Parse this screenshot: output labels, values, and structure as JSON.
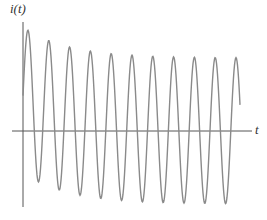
{
  "chart_data": {
    "type": "line",
    "title": "",
    "xlabel": "t",
    "ylabel": "i(t)",
    "grid": false,
    "legend": null,
    "series": [
      {
        "name": "i(t)",
        "color": "#8a8a8a",
        "model": {
          "form": "A*sin(w*t + phi) + D*exp(-t/tau)",
          "amplitude_px": 73,
          "period_px": 20.8,
          "offset_initial_px": 31,
          "tau_px": 45
        },
        "peaks_approx": [
          {
            "x": 28,
            "y": 27
          },
          {
            "x": 49,
            "y": 35
          },
          {
            "x": 70,
            "y": 46
          },
          {
            "x": 90,
            "y": 51
          },
          {
            "x": 111,
            "y": 54
          },
          {
            "x": 131,
            "y": 56
          },
          {
            "x": 152,
            "y": 57
          },
          {
            "x": 173,
            "y": 57
          },
          {
            "x": 194,
            "y": 57
          },
          {
            "x": 215,
            "y": 57
          },
          {
            "x": 236,
            "y": 57
          }
        ],
        "troughs_approx": [
          {
            "x": 39,
            "y": 172
          },
          {
            "x": 59,
            "y": 183
          },
          {
            "x": 80,
            "y": 190
          },
          {
            "x": 101,
            "y": 197
          },
          {
            "x": 121,
            "y": 201
          },
          {
            "x": 142,
            "y": 202
          },
          {
            "x": 163,
            "y": 203
          },
          {
            "x": 184,
            "y": 203
          },
          {
            "x": 205,
            "y": 203
          },
          {
            "x": 226,
            "y": 203
          }
        ]
      }
    ],
    "axes": {
      "origin_px": {
        "x": 23,
        "y": 131
      },
      "x_axis": {
        "from": 12,
        "to": 252
      },
      "y_axis": {
        "from": 22,
        "to": 207
      },
      "t_start_px": 23,
      "t_end_px": 240
    }
  },
  "labels": {
    "y": "i(t)",
    "x": "t"
  },
  "colors": {
    "axis": "#555555",
    "curve": "#8a8a8a"
  }
}
